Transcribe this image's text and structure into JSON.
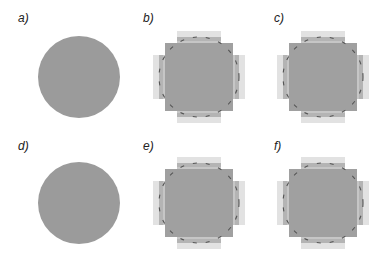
{
  "figure": {
    "colors": {
      "disk_fill": "#9b9b9b",
      "pixel_inner": "#a0a0a0",
      "pixel_mid": "#c6c6c6",
      "pixel_outer": "#e2e2e2",
      "outline": "#555555",
      "background": "#ffffff"
    },
    "panels": [
      {
        "id": "a",
        "label": "a)",
        "kind": "continuous-disk"
      },
      {
        "id": "b",
        "label": "b)",
        "kind": "pixelated-disk-with-outline"
      },
      {
        "id": "c",
        "label": "c)",
        "kind": "pixelated-disk-with-outline"
      },
      {
        "id": "d",
        "label": "d)",
        "kind": "continuous-disk"
      },
      {
        "id": "e",
        "label": "e)",
        "kind": "pixelated-disk-with-outline"
      },
      {
        "id": "f",
        "label": "f)",
        "kind": "pixelated-disk-with-outline"
      }
    ]
  }
}
